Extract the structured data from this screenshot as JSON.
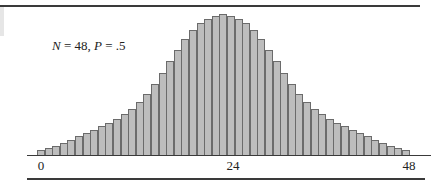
{
  "chart_data": {
    "type": "bar",
    "title": "",
    "annotation": {
      "n_label": "N",
      "n_value": "48",
      "p_label": "P",
      "p_value": ".5"
    },
    "xlabel": "",
    "ylabel": "",
    "x_tick_labels": [
      "0",
      "24",
      "48"
    ],
    "x_tick_positions": [
      0,
      24,
      48
    ],
    "xlim": [
      0,
      48
    ],
    "grid": false,
    "legend": null,
    "categories": [
      0,
      1,
      2,
      3,
      4,
      5,
      6,
      7,
      8,
      9,
      10,
      11,
      12,
      13,
      14,
      15,
      16,
      17,
      18,
      19,
      20,
      21,
      22,
      23,
      24,
      25,
      26,
      27,
      28,
      29,
      30,
      31,
      32,
      33,
      34,
      35,
      36,
      37,
      38,
      39,
      40,
      41,
      42,
      43,
      44,
      45,
      46,
      47,
      48
    ],
    "values": [
      6,
      8,
      10,
      13,
      16,
      20,
      23,
      26,
      30,
      33,
      37,
      42,
      47,
      54,
      62,
      72,
      83,
      95,
      106,
      117,
      126,
      133,
      137,
      140,
      142,
      140,
      137,
      133,
      126,
      117,
      106,
      95,
      83,
      72,
      62,
      54,
      47,
      42,
      37,
      33,
      30,
      26,
      23,
      20,
      16,
      13,
      10,
      8,
      6
    ],
    "values_note": "relative bar heights in pixels (binomial distribution shape, peak at 24)"
  },
  "labels": {
    "annotation_text_n": "N",
    "annotation_text_eq1": " = 48, ",
    "annotation_text_p": "P",
    "annotation_text_eq2": " = .5",
    "tick_0": "0",
    "tick_24": "24",
    "tick_48": "48"
  },
  "colors": {
    "bar_fill": "#bdbdbd",
    "bar_edge": "#6b6b6b",
    "rule": "#3a3a3a"
  }
}
